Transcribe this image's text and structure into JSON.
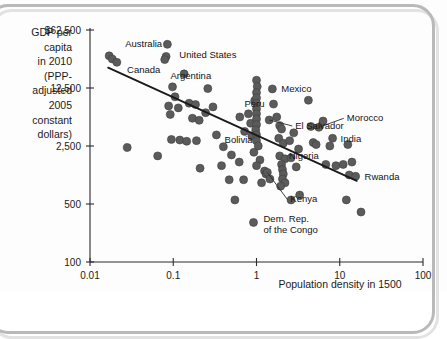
{
  "chart_data": {
    "type": "scatter",
    "title": "",
    "xlabel": "Population density in 1500",
    "ylabel": "GDP per capita in 2010 (PPP-adjusted 2005 constant dollars)",
    "ylabel_lines": [
      "GDP per",
      "capita",
      "in 2010",
      "(PPP-",
      "adjusted",
      "2005",
      "constant",
      "dollars)"
    ],
    "xscale": "log",
    "yscale": "log",
    "xticks": [
      "0.01",
      "0.1",
      "1",
      "10",
      "100"
    ],
    "xtick_values": [
      0.01,
      0.1,
      1,
      10,
      100
    ],
    "yticks": [
      "$62,500",
      "12,500",
      "2,500",
      "500",
      "100"
    ],
    "ytick_values": [
      62500,
      12500,
      2500,
      500,
      100
    ],
    "xlim": [
      0.01,
      100
    ],
    "ylim": [
      100,
      62500
    ],
    "grid": false,
    "legend": null,
    "point_color": "#5b5b5b",
    "trendline": {
      "x0": 0.0165,
      "y0": 22000,
      "x1": 16.0,
      "y1": 950,
      "color": "#1a1a1a"
    },
    "labeled_points": [
      {
        "name": "Australia",
        "x": 0.017,
        "y": 30500,
        "label_dx": 16,
        "label_dy": -9,
        "anchor": "start",
        "leader": false
      },
      {
        "name": "Canada",
        "x": 0.02,
        "y": 26000,
        "label_dx": 12,
        "label_dy": 11,
        "anchor": "start",
        "leader": false
      },
      {
        "name": "United States",
        "x": 0.085,
        "y": 30000,
        "label_dx": 12,
        "label_dy": 2,
        "anchor": "start",
        "leader": false
      },
      {
        "name": "Argentina",
        "x": 0.098,
        "y": 12900,
        "label_dx": -2,
        "label_dy": -8,
        "anchor": "start",
        "leader": false
      },
      {
        "name": "Bolivia",
        "x": 0.72,
        "y": 3750,
        "label_dx": -6,
        "label_dy": 12,
        "anchor": "middle",
        "leader": false
      },
      {
        "name": "Mexico",
        "x": 1.55,
        "y": 12200,
        "label_dx": 9,
        "label_dy": 3,
        "anchor": "start",
        "leader": false
      },
      {
        "name": "Peru",
        "x": 1.6,
        "y": 8000,
        "label_dx": -9,
        "label_dy": 3,
        "anchor": "end",
        "leader": false
      },
      {
        "name": "El Salvador",
        "x": 1.42,
        "y": 5150,
        "label_dx": 26,
        "label_dy": 9,
        "anchor": "start",
        "leader": true
      },
      {
        "name": "Morocco",
        "x": 5.6,
        "y": 4200,
        "label_dx": 28,
        "label_dy": -6,
        "anchor": "start",
        "leader": true
      },
      {
        "name": "India",
        "x": 8.2,
        "y": 3100,
        "label_dx": 8,
        "label_dy": 4,
        "anchor": "start",
        "leader": false
      },
      {
        "name": "Nigeria",
        "x": 1.9,
        "y": 1900,
        "label_dx": 9,
        "label_dy": 3,
        "anchor": "start",
        "leader": false
      },
      {
        "name": "Kenya",
        "x": 1.35,
        "y": 1200,
        "label_dx": 23,
        "label_dy": 30,
        "anchor": "start",
        "leader": true
      },
      {
        "name": "Rwanda",
        "x": 15.5,
        "y": 1080,
        "label_dx": 9,
        "label_dy": 4,
        "anchor": "start",
        "leader": false
      },
      {
        "name": "Dem. Rep. of the Congo",
        "x": 0.92,
        "y": 300,
        "label_dx": 10,
        "label_dy": 0,
        "anchor": "start",
        "leader": false,
        "lines": [
          "Dem. Rep.",
          "of the Congo"
        ]
      }
    ],
    "points": [
      {
        "x": 0.017,
        "y": 30500
      },
      {
        "x": 0.0185,
        "y": 28000
      },
      {
        "x": 0.021,
        "y": 25500
      },
      {
        "x": 0.085,
        "y": 42000
      },
      {
        "x": 0.082,
        "y": 30000
      },
      {
        "x": 0.079,
        "y": 27500
      },
      {
        "x": 0.135,
        "y": 18500
      },
      {
        "x": 0.098,
        "y": 12900
      },
      {
        "x": 0.105,
        "y": 9800
      },
      {
        "x": 0.088,
        "y": 7600
      },
      {
        "x": 0.115,
        "y": 7200
      },
      {
        "x": 0.092,
        "y": 6000
      },
      {
        "x": 0.155,
        "y": 8200
      },
      {
        "x": 0.185,
        "y": 7900
      },
      {
        "x": 0.17,
        "y": 5400
      },
      {
        "x": 0.205,
        "y": 5100
      },
      {
        "x": 0.26,
        "y": 12300
      },
      {
        "x": 0.3,
        "y": 7400
      },
      {
        "x": 0.245,
        "y": 6300
      },
      {
        "x": 0.095,
        "y": 3000
      },
      {
        "x": 0.12,
        "y": 2950
      },
      {
        "x": 0.145,
        "y": 2850
      },
      {
        "x": 0.19,
        "y": 2900
      },
      {
        "x": 0.33,
        "y": 3400
      },
      {
        "x": 0.4,
        "y": 2450
      },
      {
        "x": 0.5,
        "y": 1950
      },
      {
        "x": 0.38,
        "y": 1450
      },
      {
        "x": 0.21,
        "y": 1350
      },
      {
        "x": 0.72,
        "y": 3750
      },
      {
        "x": 0.63,
        "y": 5600
      },
      {
        "x": 0.8,
        "y": 6100
      },
      {
        "x": 0.85,
        "y": 4700
      },
      {
        "x": 0.88,
        "y": 3300
      },
      {
        "x": 0.95,
        "y": 8800
      },
      {
        "x": 1.0,
        "y": 15500
      },
      {
        "x": 1.02,
        "y": 13000
      },
      {
        "x": 1.0,
        "y": 11000
      },
      {
        "x": 1.0,
        "y": 9500
      },
      {
        "x": 1.0,
        "y": 8200
      },
      {
        "x": 1.0,
        "y": 7000
      },
      {
        "x": 1.0,
        "y": 6100
      },
      {
        "x": 1.0,
        "y": 5300
      },
      {
        "x": 1.0,
        "y": 4500
      },
      {
        "x": 0.98,
        "y": 3900
      },
      {
        "x": 1.0,
        "y": 3400
      },
      {
        "x": 1.0,
        "y": 2900
      },
      {
        "x": 1.05,
        "y": 2500
      },
      {
        "x": 0.93,
        "y": 2100
      },
      {
        "x": 1.1,
        "y": 1700
      },
      {
        "x": 1.0,
        "y": 1450
      },
      {
        "x": 1.25,
        "y": 1250
      },
      {
        "x": 1.3,
        "y": 1150
      },
      {
        "x": 1.35,
        "y": 1200
      },
      {
        "x": 1.45,
        "y": 1000
      },
      {
        "x": 1.15,
        "y": 900
      },
      {
        "x": 0.92,
        "y": 300
      },
      {
        "x": 0.55,
        "y": 560
      },
      {
        "x": 0.7,
        "y": 980
      },
      {
        "x": 0.62,
        "y": 1600
      },
      {
        "x": 0.47,
        "y": 980
      },
      {
        "x": 1.42,
        "y": 5150
      },
      {
        "x": 1.55,
        "y": 12200
      },
      {
        "x": 1.6,
        "y": 8000
      },
      {
        "x": 1.75,
        "y": 5600
      },
      {
        "x": 1.9,
        "y": 4400
      },
      {
        "x": 2.0,
        "y": 4000
      },
      {
        "x": 1.85,
        "y": 3100
      },
      {
        "x": 2.1,
        "y": 2700
      },
      {
        "x": 1.9,
        "y": 1900
      },
      {
        "x": 2.2,
        "y": 1750
      },
      {
        "x": 2.0,
        "y": 1500
      },
      {
        "x": 2.05,
        "y": 1300
      },
      {
        "x": 2.1,
        "y": 1150
      },
      {
        "x": 2.05,
        "y": 1000
      },
      {
        "x": 2.2,
        "y": 900
      },
      {
        "x": 1.95,
        "y": 820
      },
      {
        "x": 2.5,
        "y": 2900
      },
      {
        "x": 2.6,
        "y": 1800
      },
      {
        "x": 2.8,
        "y": 3600
      },
      {
        "x": 3.2,
        "y": 2300
      },
      {
        "x": 3.0,
        "y": 1400
      },
      {
        "x": 3.3,
        "y": 640
      },
      {
        "x": 2.6,
        "y": 560
      },
      {
        "x": 4.2,
        "y": 8900
      },
      {
        "x": 4.5,
        "y": 4300
      },
      {
        "x": 4.8,
        "y": 2750
      },
      {
        "x": 5.6,
        "y": 4200
      },
      {
        "x": 5.2,
        "y": 2600
      },
      {
        "x": 6.3,
        "y": 5000
      },
      {
        "x": 6.8,
        "y": 1500
      },
      {
        "x": 8.2,
        "y": 3100
      },
      {
        "x": 7.6,
        "y": 2500
      },
      {
        "x": 9.0,
        "y": 1450
      },
      {
        "x": 11.0,
        "y": 1500
      },
      {
        "x": 12.5,
        "y": 2600
      },
      {
        "x": 13.0,
        "y": 1120
      },
      {
        "x": 15.5,
        "y": 1080
      },
      {
        "x": 14.0,
        "y": 1600
      },
      {
        "x": 12.0,
        "y": 560
      },
      {
        "x": 18.0,
        "y": 400
      },
      {
        "x": 0.028,
        "y": 2400
      },
      {
        "x": 0.065,
        "y": 1900
      }
    ]
  }
}
